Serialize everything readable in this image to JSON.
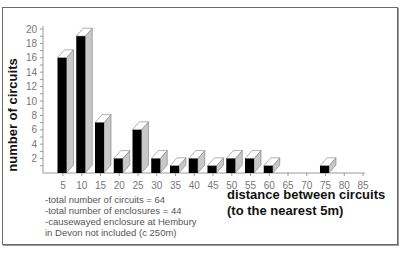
{
  "chart_data": {
    "type": "bar",
    "title": "",
    "xlabel": "distance between circuits (to the nearest 5m)",
    "xlabel_lines": [
      "distance between circuits",
      "(to the nearest 5m)"
    ],
    "ylabel": "number of circuits",
    "categories": [
      "5",
      "10",
      "15",
      "20",
      "25",
      "30",
      "35",
      "40",
      "45",
      "50",
      "55",
      "60",
      "65",
      "70",
      "75",
      "80",
      "85"
    ],
    "values": [
      16,
      19,
      7,
      2,
      6,
      2,
      1,
      2,
      1,
      2,
      2,
      1,
      0,
      0,
      1,
      0,
      0
    ],
    "yticks": [
      2,
      4,
      6,
      8,
      10,
      12,
      14,
      16,
      18,
      20
    ],
    "ylim": [
      0,
      20
    ],
    "grid": false,
    "legend": null,
    "style": "3d-bar",
    "colors": {
      "front": "#000000",
      "side": "#c8c8c8",
      "top": "#ffffff",
      "axis": "#9a9a9a",
      "tick_text": "#777777"
    },
    "annotations": [
      "-total number of circuits = 64",
      "-total number of enclosures = 44",
      "-causewayed enclosure at Hembury",
      "in Devon not included (c 250m)"
    ]
  }
}
